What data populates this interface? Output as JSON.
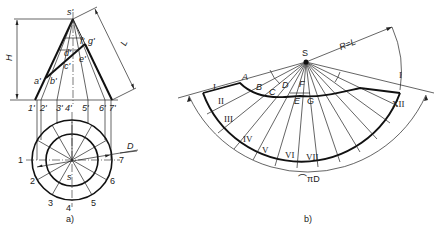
{
  "figure_a": {
    "caption": "a)",
    "dims": {
      "height_label": "H",
      "slant_label": "L",
      "diameter_label": "D"
    },
    "front_view_labels": {
      "apex": "s'",
      "generators": [
        "1'",
        "2'",
        "3'",
        "4'",
        "5'",
        "6'",
        "7'"
      ],
      "cut_points": [
        "a'",
        "b'",
        "c'",
        "d'",
        "e'",
        "f'",
        "g'"
      ]
    },
    "top_view_labels": {
      "apex": "s",
      "points": [
        "1",
        "2",
        "3",
        "4",
        "5",
        "6",
        "7"
      ]
    }
  },
  "figure_b": {
    "caption": "b)",
    "apex": "S",
    "radius_label": "R=L",
    "arc_label": "⌒πD",
    "inner_points": [
      "A",
      "B",
      "C",
      "D",
      "E",
      "F",
      "G"
    ],
    "roman_left": [
      "I",
      "II",
      "III",
      "IV",
      "V",
      "VI",
      "VII"
    ],
    "roman_right": [
      "XII",
      "I"
    ]
  }
}
